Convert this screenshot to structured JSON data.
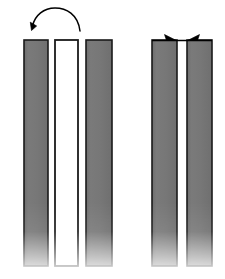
{
  "figure": {
    "title": "",
    "canvas": {
      "width": 225,
      "height": 279,
      "background": "#ffffff"
    },
    "colors": {
      "bar_fill": "#767676",
      "bar_fill_light": "#7e7e7e",
      "outline": "#1a1a1a",
      "white_fill": "#ffffff",
      "arrow": "#000000"
    },
    "left_group": {
      "name": "open-state",
      "bars": [
        {
          "id": "left-bar-1",
          "label": "gray-strip-left",
          "fill": "gray",
          "x": 24,
          "width": 24,
          "top": 40,
          "bottom": 266
        },
        {
          "id": "left-bar-2",
          "label": "white-strip-center",
          "fill": "white",
          "x": 55,
          "width": 23,
          "top": 40,
          "bottom": 266
        },
        {
          "id": "left-bar-3",
          "label": "gray-strip-right",
          "fill": "gray",
          "x": 86,
          "width": 26,
          "top": 40,
          "bottom": 266
        }
      ],
      "arrow": {
        "id": "rotation-arrow",
        "type": "curved-arc",
        "direction": "right-to-left",
        "start_x": 80,
        "start_y": 30,
        "end_x": 33,
        "end_y": 27,
        "apex_x": 56,
        "apex_y": 11
      }
    },
    "right_group": {
      "name": "closed-state",
      "bars": [
        {
          "id": "right-bar-1",
          "label": "gray-strip-left",
          "fill": "gray",
          "x": 152,
          "width": 25,
          "top": 40,
          "bottom": 266
        },
        {
          "id": "right-bar-2",
          "label": "gray-strip-right",
          "fill": "gray",
          "x": 187,
          "width": 25,
          "top": 40,
          "bottom": 266
        }
      ],
      "arrows": [
        {
          "id": "converge-arrow-left",
          "direction": "right",
          "tip_x": 174,
          "tip_y": 40
        },
        {
          "id": "converge-arrow-right",
          "direction": "left",
          "tip_x": 190,
          "tip_y": 40
        }
      ],
      "connector_line": {
        "x1": 152,
        "x2": 212,
        "y": 40
      }
    },
    "fade": {
      "enabled": true,
      "start_y": 215,
      "end_y": 266,
      "note": "bars fade from solid to white toward the bottom"
    }
  }
}
